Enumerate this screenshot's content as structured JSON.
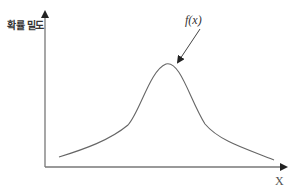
{
  "diagram": {
    "y_axis_label": "확률 밀도",
    "x_axis_label": "X",
    "curve_label": "f(x)",
    "curve_color": "#666666",
    "axis_color": "#777777"
  }
}
